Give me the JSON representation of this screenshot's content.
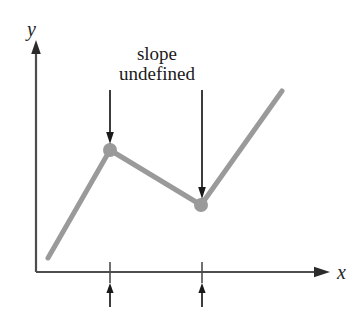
{
  "figure": {
    "kind": "math-graph",
    "background_color": "#ffffff"
  },
  "axes": {
    "y_label": "y",
    "x_label": "x",
    "axis_color": "#4d4d4d",
    "origin_px": {
      "x": 36,
      "y": 272
    },
    "y_axis_top_px": 42,
    "x_axis_right_px": 327
  },
  "annotation": {
    "line1": "slope",
    "line2": "undefined",
    "text_color": "#1a1a1a",
    "arrow_color": "#1a1a1a",
    "arrows": [
      {
        "name": "arrow-to-corner-1",
        "x": 110,
        "y_start": 90,
        "y_end": 143
      },
      {
        "name": "arrow-to-corner-2",
        "x": 202,
        "y_start": 90,
        "y_end": 198
      }
    ]
  },
  "ticks": {
    "tick_color": "#4d4d4d",
    "marker_color": "#1a1a1a",
    "items": [
      {
        "name": "x-tick-1",
        "x": 110
      },
      {
        "name": "x-tick-2",
        "x": 202
      }
    ],
    "under_arrows": [
      {
        "name": "x-marker-arrow-1",
        "x": 110,
        "y_start": 305,
        "y_end": 283
      },
      {
        "name": "x-marker-arrow-2",
        "x": 202,
        "y_start": 305,
        "y_end": 283
      }
    ]
  },
  "chart_data": {
    "type": "line",
    "title": "",
    "xlabel": "x",
    "ylabel": "y",
    "grid": false,
    "legend": null,
    "curve_color": "#9a9a9a",
    "curve_width": 5,
    "points_px": [
      {
        "x": 48,
        "y": 258
      },
      {
        "x": 110,
        "y": 150
      },
      {
        "x": 201,
        "y": 205
      },
      {
        "x": 282,
        "y": 91
      }
    ],
    "marked_points": [
      {
        "name": "corner-point-1",
        "x": 110,
        "y": 150,
        "r": 7,
        "color": "#9a9a9a",
        "note": "slope undefined"
      },
      {
        "name": "corner-point-2",
        "x": 201,
        "y": 205,
        "r": 7,
        "color": "#9a9a9a",
        "note": "slope undefined"
      }
    ],
    "annotations": [
      "slope",
      "undefined"
    ]
  }
}
